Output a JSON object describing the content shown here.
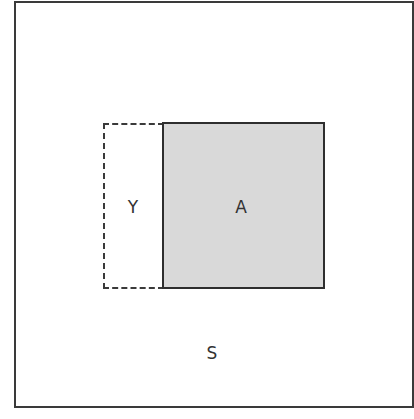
{
  "diagram": {
    "outer_region": {
      "label": "S",
      "border_color": "#3a3a3a",
      "fill_color": "#ffffff"
    },
    "regions": [
      {
        "id": "Y",
        "label": "Y",
        "border_style": "dashed",
        "fill_color": "#ffffff"
      },
      {
        "id": "A",
        "label": "A",
        "border_style": "solid",
        "fill_color": "#d9d9d9"
      }
    ]
  }
}
